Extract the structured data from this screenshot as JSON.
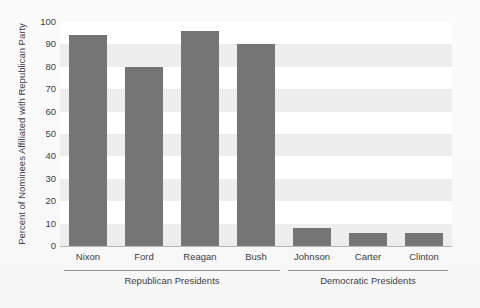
{
  "chart_data": {
    "type": "bar",
    "title": "",
    "xlabel": "",
    "ylabel": "Percent of Nominees Affiliated with Republican Party",
    "categories": [
      "Nixon",
      "Ford",
      "Reagan",
      "Bush",
      "Johnson",
      "Carter",
      "Clinton"
    ],
    "values": [
      94,
      80,
      96,
      90,
      8,
      6,
      6
    ],
    "ylim": [
      0,
      100
    ],
    "yticks": [
      0,
      10,
      20,
      30,
      40,
      50,
      60,
      70,
      80,
      90,
      100
    ],
    "ytick_labels": [
      "0",
      "10",
      "20",
      "30",
      "40",
      "50",
      "60",
      "70",
      "80",
      "90",
      "100"
    ],
    "grid": false,
    "banded_background": true,
    "legend": null,
    "bar_color": "#757575",
    "band_color": "#ededed",
    "plot_background": "#ffffff",
    "groups": [
      {
        "label": "Republican Presidents",
        "members": [
          "Nixon",
          "Ford",
          "Reagan",
          "Bush"
        ]
      },
      {
        "label": "Democratic Presidents",
        "members": [
          "Johnson",
          "Carter",
          "Clinton"
        ]
      }
    ]
  }
}
